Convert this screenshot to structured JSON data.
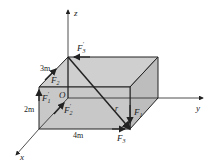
{
  "diagram": {
    "axes": {
      "x": "x",
      "y": "y",
      "z": "z",
      "origin": "O"
    },
    "dimensions": {
      "depth": "3m",
      "height": "2m",
      "width": "4m"
    },
    "forces": {
      "F1": "F",
      "F1_sub": "1",
      "F1p": "F",
      "F1p_sub": "1",
      "F1p_prime": "′",
      "F2": "F",
      "F2_sub": "2",
      "F2p": "F",
      "F2p_sub": "2",
      "F2p_prime": "′",
      "F3": "F",
      "F3_sub": "3",
      "F3p": "F",
      "F3p_sub": "3",
      "F3p_prime": "′"
    },
    "diagonal_label": "r",
    "colors": {
      "box_fill": "#c8c8c8",
      "line": "#222222"
    }
  }
}
